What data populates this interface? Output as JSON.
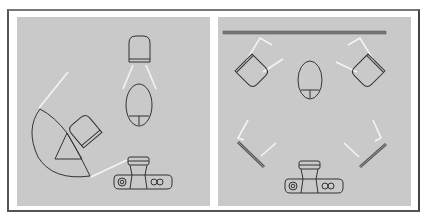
{
  "figure": {
    "title": "",
    "colors": {
      "background": "#ffffff",
      "panel": "#c9c9c9",
      "line": "#333333",
      "light_ray": "#f4f4f4",
      "reflector": "#777777"
    },
    "panels": [
      {
        "id": "left",
        "description": "Umbrella light setup with backlight",
        "elements": [
          "umbrella-reflector",
          "main-light",
          "back-light",
          "subject",
          "camera",
          "light-rays"
        ]
      },
      {
        "id": "right",
        "description": "Background lights with side reflectors",
        "elements": [
          "background-bar",
          "left-light",
          "right-light",
          "subject",
          "left-reflector",
          "right-reflector",
          "camera",
          "light-rays"
        ]
      }
    ]
  }
}
